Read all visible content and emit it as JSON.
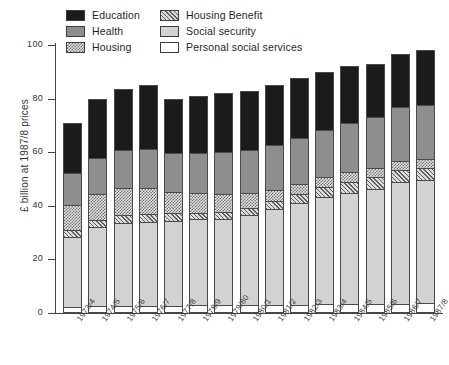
{
  "chart_data": {
    "type": "bar",
    "subtype": "stacked",
    "title": "",
    "xlabel": "",
    "ylabel": "£ billion at 1987/8 prices",
    "ylim": [
      0,
      100
    ],
    "yticks": [
      0,
      20,
      40,
      60,
      80,
      100
    ],
    "ytick_labels": [
      "0",
      "20",
      "40",
      "60",
      "80",
      "100"
    ],
    "grid": false,
    "legend_position": "top-inside",
    "categories": [
      "1973/4",
      "1974/5",
      "1975/6",
      "1976/7",
      "1977/8",
      "1978/9",
      "1979/80",
      "1980/1",
      "1981/2",
      "1982/3",
      "1983/4",
      "1984/5",
      "1985/6",
      "1986/7",
      "1987/8"
    ],
    "series": [
      {
        "name": "Personal social services",
        "color": "#ffffff",
        "pattern": "solid",
        "values": [
          2.2,
          2.5,
          2.7,
          2.8,
          2.8,
          2.9,
          2.9,
          3.0,
          3.0,
          3.1,
          3.2,
          3.3,
          3.4,
          3.5,
          3.6
        ]
      },
      {
        "name": "Social security",
        "color": "#d2d2d2",
        "pattern": "solid",
        "values": [
          26.3,
          29.5,
          31.0,
          31.2,
          31.7,
          32.0,
          32.3,
          33.5,
          36.0,
          38.0,
          40.0,
          41.5,
          43.0,
          45.5,
          46.0
        ]
      },
      {
        "name": "Housing Benefit",
        "color": "#dcdcdc",
        "pattern": "diagonal-hatch",
        "values": [
          2.6,
          2.8,
          3.0,
          3.1,
          2.7,
          2.6,
          2.6,
          2.6,
          2.8,
          3.2,
          3.8,
          4.2,
          4.4,
          4.5,
          4.4
        ]
      },
      {
        "name": "Housing",
        "color": "#e3e3e3",
        "pattern": "checker",
        "values": [
          9.2,
          9.5,
          9.8,
          9.4,
          7.8,
          7.3,
          6.8,
          5.6,
          4.2,
          3.8,
          3.6,
          3.5,
          3.4,
          3.4,
          3.3
        ]
      },
      {
        "name": "Health",
        "color": "#8e8e8e",
        "pattern": "solid",
        "values": [
          12.0,
          13.4,
          14.4,
          14.6,
          14.7,
          15.0,
          15.4,
          16.2,
          16.8,
          17.2,
          17.8,
          18.4,
          18.8,
          19.8,
          20.4
        ]
      },
      {
        "name": "Education",
        "color": "#1b1b1b",
        "pattern": "solid",
        "values": [
          18.7,
          22.3,
          22.6,
          23.9,
          20.3,
          21.2,
          22.0,
          22.1,
          22.2,
          22.5,
          21.6,
          21.1,
          20.0,
          19.8,
          20.3
        ]
      }
    ],
    "totals": [
      71.0,
      80.0,
      83.5,
      85.0,
      80.0,
      81.0,
      82.0,
      83.0,
      85.0,
      87.8,
      90.0,
      92.0,
      93.0,
      96.5,
      98.0
    ]
  },
  "legend": {
    "items": [
      {
        "label": "Education",
        "key": "education"
      },
      {
        "label": "Housing Benefit",
        "key": "housing-benefit"
      },
      {
        "label": "Health",
        "key": "health"
      },
      {
        "label": "Social security",
        "key": "social-security"
      },
      {
        "label": "Housing",
        "key": "housing"
      },
      {
        "label": "Personal social services",
        "key": "personal-social"
      }
    ]
  }
}
